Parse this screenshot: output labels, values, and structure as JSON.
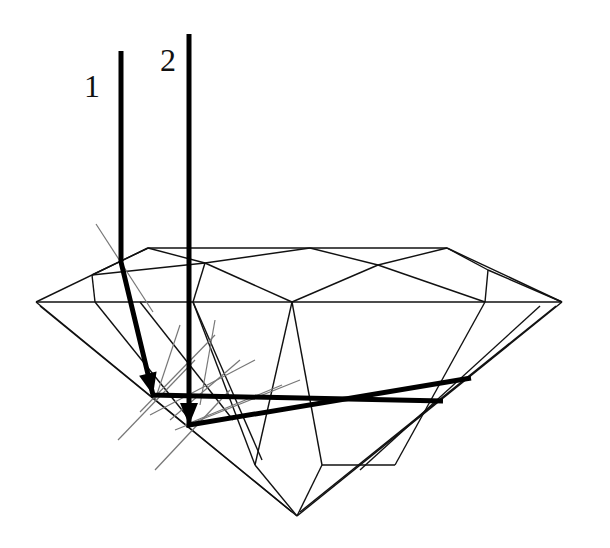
{
  "labels": [
    {
      "id": "ray-1",
      "text": "1",
      "x": 84,
      "y": 70
    },
    {
      "id": "ray-2",
      "text": "2",
      "x": 162,
      "y": 44
    }
  ],
  "colors": {
    "outline": "#111111",
    "ray": "#000000",
    "normal": "#777777"
  },
  "outline_lines": [
    [
      36,
      302,
      148,
      248
    ],
    [
      148,
      248,
      447,
      248
    ],
    [
      447,
      248,
      562,
      302
    ],
    [
      36,
      302,
      562,
      302
    ],
    [
      36,
      302,
      297,
      516
    ],
    [
      562,
      302,
      297,
      516
    ],
    [
      40,
      306,
      292,
      512
    ],
    [
      556,
      306,
      300,
      512
    ],
    [
      148,
      248,
      205,
      263
    ],
    [
      205,
      263,
      310,
      248
    ],
    [
      447,
      248,
      378,
      265
    ],
    [
      378,
      265,
      310,
      248
    ],
    [
      92,
      275,
      148,
      248
    ],
    [
      92,
      275,
      205,
      263
    ],
    [
      205,
      263,
      193,
      302
    ],
    [
      92,
      275,
      95,
      302
    ],
    [
      205,
      263,
      292,
      302
    ],
    [
      378,
      265,
      292,
      302
    ],
    [
      378,
      265,
      485,
      302
    ],
    [
      488,
      270,
      447,
      248
    ],
    [
      488,
      270,
      485,
      302
    ],
    [
      488,
      270,
      562,
      302
    ],
    [
      95,
      302,
      190,
      420
    ],
    [
      485,
      302,
      395,
      465
    ],
    [
      540,
      306,
      360,
      470
    ],
    [
      292,
      302,
      255,
      465
    ],
    [
      292,
      302,
      322,
      465
    ],
    [
      255,
      465,
      297,
      516
    ],
    [
      322,
      465,
      297,
      516
    ],
    [
      193,
      302,
      255,
      465
    ],
    [
      193,
      302,
      262,
      460
    ],
    [
      395,
      465,
      322,
      465
    ],
    [
      140,
      302,
      233,
      420
    ]
  ],
  "normal_lines": [
    [
      96,
      224,
      153,
      312
    ],
    [
      118,
      440,
      195,
      360
    ],
    [
      155,
      470,
      230,
      390
    ],
    [
      180,
      325,
      155,
      400
    ],
    [
      215,
      335,
      140,
      412
    ],
    [
      255,
      360,
      150,
      415
    ],
    [
      240,
      360,
      170,
      420
    ],
    [
      282,
      385,
      185,
      425
    ],
    [
      215,
      320,
      200,
      405
    ],
    [
      300,
      380,
      175,
      430
    ]
  ],
  "ray_paths": [
    {
      "id": "ray-1-path",
      "points": [
        [
          121,
          51
        ],
        [
          121,
          262
        ],
        [
          153,
          395
        ],
        [
          443,
          401
        ]
      ],
      "arrow_at": 2
    },
    {
      "id": "ray-2-path",
      "points": [
        [
          189,
          34
        ],
        [
          189,
          425
        ],
        [
          471,
          378
        ]
      ],
      "arrow_at": 1
    }
  ]
}
